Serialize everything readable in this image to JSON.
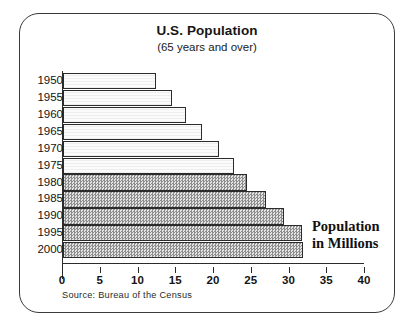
{
  "chart_data": {
    "type": "bar",
    "orientation": "horizontal",
    "title": "U.S. Population",
    "subtitle": "(65 years and over)",
    "xlabel": "Population in Millions",
    "ylabel": "",
    "xlim": [
      0,
      40
    ],
    "ylim": null,
    "grid": false,
    "legend": null,
    "source": "Source: Bureau of the Census",
    "categories": [
      "1950",
      "1955",
      "1960",
      "1965",
      "1970",
      "1975",
      "1980",
      "1985",
      "1990",
      "1995",
      "2000"
    ],
    "values": [
      12.3,
      14.5,
      16.3,
      18.4,
      20.7,
      22.7,
      24.4,
      26.9,
      29.3,
      31.6,
      31.8
    ],
    "xticks": [
      0,
      5,
      10,
      15,
      20,
      25,
      30,
      35,
      40
    ],
    "xtick_labels": [
      "0",
      "5",
      "10",
      "15",
      "20",
      "25",
      "30",
      "35",
      "40"
    ],
    "bar_styles": [
      "light",
      "light",
      "light",
      "light",
      "light",
      "light",
      "dark",
      "dark",
      "dark",
      "dark",
      "dark"
    ],
    "colors": {
      "light_fill": "#fbfbfb",
      "dark_fill": "#b9b9b9",
      "outline": "#2b2b2b",
      "text": "#141414",
      "frame": "#3a3a3a"
    }
  },
  "axis_note": {
    "line1": "Population",
    "line2": "in Millions"
  }
}
